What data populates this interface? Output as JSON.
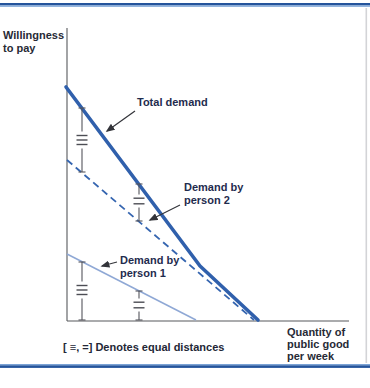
{
  "figure": {
    "accent_dark": "#24549c",
    "accent_light": "#7ba3d6",
    "curve_blue": "#3060ac",
    "curve_light_blue": "#8fa8d5"
  },
  "axis_labels": {
    "y_line1": "Willingness",
    "y_line2": "to pay",
    "x_line1": "Quantity of",
    "x_line2": "public good",
    "x_line3": "per week"
  },
  "curve_labels": {
    "total": "Total demand",
    "p2_line1": "Demand by",
    "p2_line2": "person 2",
    "p1_line1": "Demand by",
    "p1_line2": "person 1"
  },
  "caption": "[ ≡, =] Denotes equal distances",
  "chart_data": {
    "type": "line",
    "ylabel": "Willingness to pay",
    "xlabel": "Quantity of public good per week",
    "axis_ticks": "none (schematic axes, arbitrary units)",
    "legend_position": "inline-annotations",
    "grid": false,
    "series": [
      {
        "name": "Total demand",
        "style": "solid-thick",
        "color": "#3060ac",
        "points_axis_units": [
          [
            0,
            80
          ],
          [
            47,
            19
          ],
          [
            68,
            0
          ]
        ],
        "svg_points": "66,87 200,266 258,320",
        "note": "kinked: vertical sum of person 1 and person 2 demands"
      },
      {
        "name": "Demand by person 2",
        "style": "dashed",
        "color": "#3565b0",
        "points_axis_units": [
          [
            0,
            55
          ],
          [
            66,
            0
          ]
        ],
        "svg_points": "67,160 254,320"
      },
      {
        "name": "Demand by person 1",
        "style": "solid-thin",
        "color": "#8fa8d5",
        "points_axis_units": [
          [
            0,
            23
          ],
          [
            46,
            0
          ]
        ],
        "svg_points": "67,254 196,320"
      }
    ],
    "annotations": "Vertical I-bar markers with ≡ and = symbols mark equal vertical distances between Total demand and person 2's demand, and between person 1's demand and the quantity axis"
  },
  "geometry": {
    "y_axis": "67,28 67,321",
    "x_axis": "67,321 349,321",
    "arrow_total": "135,111 107,131",
    "arrow_p2": "180,205 150,220",
    "arrow_p1": "117,262 102,266"
  },
  "markers": [
    {
      "x": 82,
      "top": 108,
      "bottom": 172,
      "symbol": "triple",
      "symbol_y": 140
    },
    {
      "x": 139,
      "top": 184,
      "bottom": 221,
      "symbol": "double",
      "symbol_y": 201
    },
    {
      "x": 82,
      "top": 262,
      "bottom": 320,
      "symbol": "triple",
      "symbol_y": 290
    },
    {
      "x": 139,
      "top": 291,
      "bottom": 320,
      "symbol": "double",
      "symbol_y": 305
    }
  ]
}
